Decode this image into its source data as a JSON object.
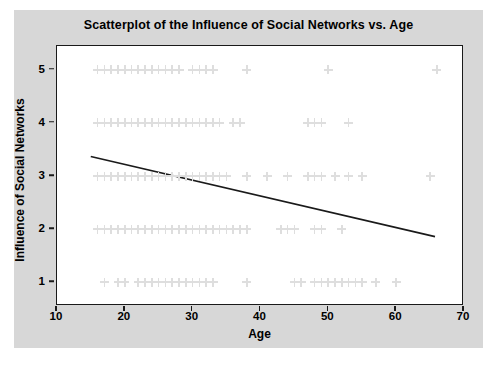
{
  "chart_data": {
    "type": "scatter",
    "title": "Scatterplot of the Influence of Social Networks vs. Age",
    "xlabel": "Age",
    "ylabel": "Influence of Social Networks",
    "xlim": [
      10,
      70
    ],
    "ylim": [
      0.55,
      5.45
    ],
    "xticks": [
      10,
      20,
      30,
      40,
      50,
      60,
      70
    ],
    "xtick_labels": [
      "10",
      "20",
      "30",
      "40",
      "50",
      "60",
      "70"
    ],
    "yticks": [
      1,
      2,
      3,
      4,
      5
    ],
    "ytick_labels": [
      "1",
      "2",
      "3",
      "4",
      "5"
    ],
    "grid": false,
    "legend": false,
    "marker": "plus-cross",
    "marker_color": "#dedede",
    "series": [
      {
        "name": "Respondents",
        "x": [
          16,
          17,
          17,
          18,
          18,
          19,
          19,
          20,
          20,
          21,
          22,
          22,
          23,
          24,
          24,
          25,
          26,
          27,
          28,
          30,
          31,
          32,
          33,
          38,
          50,
          66
        ],
        "y": [
          5,
          5,
          5,
          5,
          5,
          5,
          5,
          5,
          5,
          5,
          5,
          5,
          5,
          5,
          5,
          5,
          5,
          5,
          5,
          5,
          5,
          5,
          5,
          5,
          5,
          5
        ]
      },
      {
        "name": "Respondents",
        "x": [
          16,
          17,
          18,
          18,
          19,
          19,
          20,
          20,
          21,
          21,
          22,
          23,
          23,
          24,
          25,
          25,
          26,
          27,
          28,
          29,
          30,
          31,
          32,
          33,
          34,
          36,
          37,
          47,
          48,
          49,
          53
        ],
        "y": [
          4,
          4,
          4,
          4,
          4,
          4,
          4,
          4,
          4,
          4,
          4,
          4,
          4,
          4,
          4,
          4,
          4,
          4,
          4,
          4,
          4,
          4,
          4,
          4,
          4,
          4,
          4,
          4,
          4,
          4,
          4
        ]
      },
      {
        "name": "Respondents",
        "x": [
          16,
          17,
          17,
          18,
          18,
          19,
          19,
          20,
          20,
          21,
          21,
          22,
          22,
          23,
          23,
          24,
          24,
          25,
          25,
          26,
          27,
          28,
          29,
          30,
          31,
          32,
          33,
          34,
          35,
          38,
          41,
          44,
          47,
          48,
          49,
          51,
          53,
          55,
          65
        ],
        "y": [
          3,
          3,
          3,
          3,
          3,
          3,
          3,
          3,
          3,
          3,
          3,
          3,
          3,
          3,
          3,
          3,
          3,
          3,
          3,
          3,
          3,
          3,
          3,
          3,
          3,
          3,
          3,
          3,
          3,
          3,
          3,
          3,
          3,
          3,
          3,
          3,
          3,
          3,
          3
        ]
      },
      {
        "name": "Respondents",
        "x": [
          16,
          17,
          17,
          18,
          18,
          19,
          19,
          20,
          20,
          21,
          21,
          22,
          22,
          23,
          23,
          24,
          24,
          25,
          25,
          26,
          26,
          27,
          27,
          28,
          28,
          29,
          30,
          31,
          32,
          33,
          34,
          35,
          36,
          37,
          38,
          43,
          44,
          45,
          48,
          49,
          52
        ],
        "y": [
          2,
          2,
          2,
          2,
          2,
          2,
          2,
          2,
          2,
          2,
          2,
          2,
          2,
          2,
          2,
          2,
          2,
          2,
          2,
          2,
          2,
          2,
          2,
          2,
          2,
          2,
          2,
          2,
          2,
          2,
          2,
          2,
          2,
          2,
          2,
          2,
          2,
          2,
          2,
          2,
          2
        ]
      },
      {
        "name": "Respondents",
        "x": [
          17,
          19,
          20,
          22,
          23,
          24,
          25,
          26,
          27,
          28,
          29,
          30,
          31,
          32,
          33,
          38,
          45,
          46,
          48,
          49,
          50,
          51,
          52,
          53,
          54,
          55,
          57,
          60
        ],
        "y": [
          1,
          1,
          1,
          1,
          1,
          1,
          1,
          1,
          1,
          1,
          1,
          1,
          1,
          1,
          1,
          1,
          1,
          1,
          1,
          1,
          1,
          1,
          1,
          1,
          1,
          1,
          1,
          1
        ]
      }
    ],
    "trendline": {
      "name": "Linear fit",
      "color": "#1a1a1a",
      "x_start": 15.0,
      "y_start": 3.35,
      "x_end": 66.0,
      "y_end": 1.83
    }
  },
  "colors": {
    "panel_background": "#d7d7d7",
    "plot_background": "#ffffff",
    "frame": "#1a1a1a",
    "text": "#000000",
    "marker": "#dedede",
    "trendline": "#1a1a1a"
  }
}
